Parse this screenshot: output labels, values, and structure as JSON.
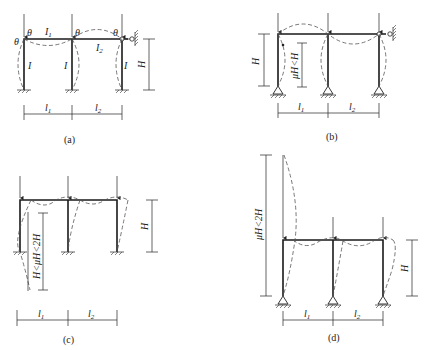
{
  "figure": {
    "panels": [
      {
        "id": "a",
        "caption": "(a)",
        "labels": {
          "span1": "l1",
          "span2": "l2",
          "beam1": "I1",
          "beam2": "I2",
          "col": "I",
          "height": "H",
          "rotation": "θ"
        },
        "supports": "fixed",
        "right_end": "guided"
      },
      {
        "id": "b",
        "caption": "(b)",
        "labels": {
          "span1": "l1",
          "span2": "l2",
          "height": "H",
          "eff_length": "μH<H"
        },
        "supports": "pinned",
        "right_end": "guided"
      },
      {
        "id": "c",
        "caption": "(c)",
        "labels": {
          "span1": "l1",
          "span2": "l2",
          "height": "H",
          "eff_length": "H<μH<2H"
        },
        "supports": "fixed",
        "right_end": "free (sway)"
      },
      {
        "id": "d",
        "caption": "(d)",
        "labels": {
          "span1": "l1",
          "span2": "l2",
          "height": "H",
          "eff_length": "μH<2H"
        },
        "supports": "pinned",
        "right_end": "free (sway)"
      }
    ]
  },
  "text": {
    "a_caption": "(a)",
    "b_caption": "(b)",
    "c_caption": "(c)",
    "d_caption": "(d)",
    "l1": "l",
    "l2": "l",
    "sub1": "1",
    "sub2": "2",
    "I": "I",
    "H": "H",
    "theta": "θ",
    "b_eff": "μH<H",
    "c_eff": "H<μH<2H",
    "d_eff": "μH<2H"
  }
}
